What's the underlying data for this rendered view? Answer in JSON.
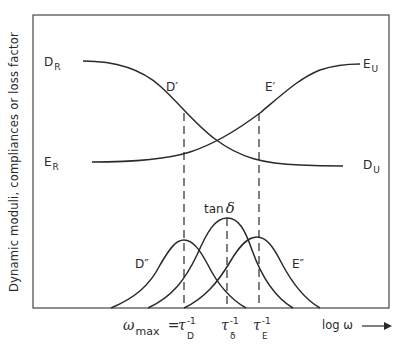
{
  "figure": {
    "y_axis_label": "Dynamic moduli, compliances or loss factor",
    "x_axis_label": "log ω",
    "x_axis_arrow": "→"
  },
  "curves": {
    "D_prime": {
      "label": "D′",
      "start_label_main": "D",
      "start_label_sub": "R",
      "end_label_main": "D",
      "end_label_sub": "U"
    },
    "E_prime": {
      "label": "E′",
      "start_label_main": "E",
      "start_label_sub": "R",
      "end_label_main": "E",
      "end_label_sub": "U"
    },
    "D_double_prime": {
      "label": "D″"
    },
    "E_double_prime": {
      "label": "E″"
    },
    "tan_delta": {
      "label_text": "tan",
      "label_symbol": "δ"
    }
  },
  "ticks": {
    "omega_max": {
      "symbol": "ω",
      "sub": "max",
      "equals": "="
    },
    "tau_D": {
      "symbol": "τ",
      "sup": "-1",
      "sub": "D"
    },
    "tau_delta": {
      "symbol": "τ",
      "sup": "-1",
      "sub": "δ"
    },
    "tau_E": {
      "symbol": "τ",
      "sup": "-1",
      "sub": "E"
    }
  },
  "colors": {
    "line": "#2a2a2a",
    "background": "#ffffff"
  }
}
